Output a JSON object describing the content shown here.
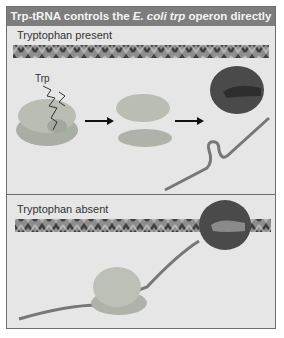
{
  "title": {
    "prefix": "Trp-tRNA controls the ",
    "species": "E. coli trp",
    "suffix": " operon directly"
  },
  "panels": [
    {
      "label": "Tryptophan present",
      "molecule_label": "Trp",
      "elements": [
        "dna-helix",
        "ribosome-with-trp-trna",
        "arrow",
        "dissociated-ribosome-subunits",
        "arrow",
        "rna-polymerase",
        "mrna-hairpin"
      ]
    },
    {
      "label": "Tryptophan absent",
      "elements": [
        "dna-helix",
        "rna-polymerase-on-dna",
        "mrna",
        "translating-ribosome"
      ]
    }
  ],
  "colors": {
    "title_bar": "#7d7d7d",
    "panel_bg": "#e6e6e6",
    "ribosome": "#b9bdb4",
    "polymerase": "#4a4a4a",
    "mrna": "#777777",
    "dna": "#9a9a9a"
  }
}
